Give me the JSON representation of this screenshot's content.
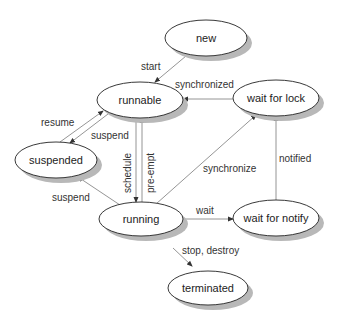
{
  "diagram": {
    "nodes": {
      "new": {
        "label": "new",
        "cx": 206,
        "cy": 38,
        "rx": 41,
        "ry": 18
      },
      "runnable": {
        "label": "runnable",
        "cx": 140,
        "cy": 100,
        "rx": 43,
        "ry": 18
      },
      "wait_for_lock": {
        "label": "wait for lock",
        "cx": 276,
        "cy": 98,
        "rx": 43,
        "ry": 18
      },
      "suspended": {
        "label": "suspended",
        "cx": 56,
        "cy": 160,
        "rx": 41,
        "ry": 18
      },
      "running": {
        "label": "running",
        "cx": 141,
        "cy": 219,
        "rx": 42,
        "ry": 17
      },
      "wait_for_notify": {
        "label": "wait for notify",
        "cx": 276,
        "cy": 218,
        "rx": 43,
        "ry": 18
      },
      "terminated": {
        "label": "terminated",
        "cx": 208,
        "cy": 288,
        "rx": 40,
        "ry": 17
      }
    },
    "edges": {
      "start": {
        "label": "start",
        "from": "new",
        "to": "runnable"
      },
      "synchronized": {
        "label": "synchronized",
        "from": "wait_for_lock",
        "to": "runnable"
      },
      "resume": {
        "label": "resume",
        "from": "suspended",
        "to": "runnable"
      },
      "suspend_runnable": {
        "label": "suspend",
        "from": "runnable",
        "to": "suspended"
      },
      "schedule": {
        "label": "schedule",
        "from": "runnable",
        "to": "running"
      },
      "pre_empt": {
        "label": "pre-empt",
        "from": "running",
        "to": "runnable"
      },
      "suspend_running": {
        "label": "suspend",
        "from": "running",
        "to": "suspended"
      },
      "synchronize": {
        "label": "synchronize",
        "from": "running",
        "to": "wait_for_lock"
      },
      "wait": {
        "label": "wait",
        "from": "running",
        "to": "wait_for_notify"
      },
      "notified": {
        "label": "notified",
        "from": "wait_for_notify",
        "to": "wait_for_lock"
      },
      "stop_destroy": {
        "label": "stop, destroy",
        "from": "running",
        "to": "terminated"
      }
    }
  }
}
